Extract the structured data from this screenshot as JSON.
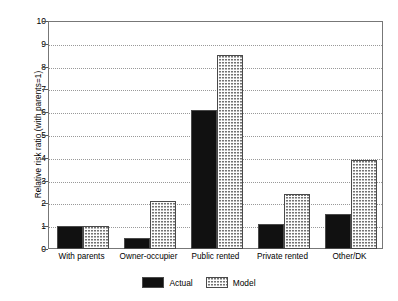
{
  "chart_data": {
    "type": "bar",
    "title": "",
    "xlabel": "",
    "ylabel": "Relative risk ratio (with parents=1)",
    "categories": [
      "With parents",
      "Owner-occupier",
      "Public rented",
      "Private rented",
      "Other/DK"
    ],
    "series": [
      {
        "name": "Actual",
        "color": "#111111",
        "values": [
          1.0,
          0.5,
          6.1,
          1.1,
          1.55
        ]
      },
      {
        "name": "Model",
        "color": "#b6b6b6",
        "values": [
          1.0,
          2.1,
          8.5,
          2.4,
          3.9
        ]
      }
    ],
    "ylim": [
      0,
      10
    ],
    "yticks": [
      "0",
      "1",
      "2",
      "3",
      "4",
      "5",
      "6",
      "7",
      "8",
      "9",
      "10"
    ],
    "grid": true,
    "grid_axis": "y",
    "grid_style": "dotted",
    "legend_position": "bottom-center",
    "legend": [
      "Actual",
      "Model"
    ]
  }
}
